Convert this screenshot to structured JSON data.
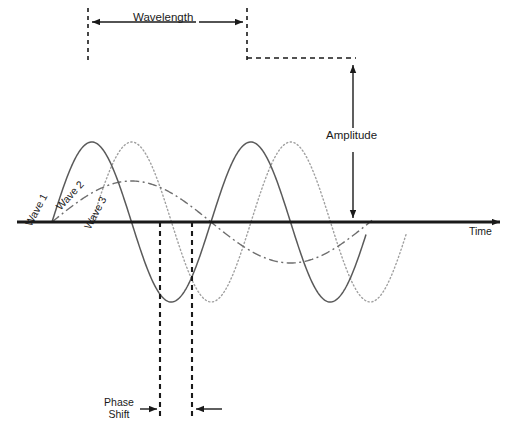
{
  "labels": {
    "wavelength": "Wavelength",
    "amplitude": "Amplitude",
    "time_axis": "Time",
    "phase_shift_line1": "Phase",
    "phase_shift_line2": "Shift",
    "wave_1": "Wave 1",
    "wave_2": "Wave 2",
    "wave_3": "Wave 3"
  },
  "colors": {
    "axis": "#1a1a1a",
    "text": "#1a1a1a",
    "wave_1": "#5a5a5a",
    "wave_2": "#6e6e6e",
    "wave_3": "#a0a0a0",
    "guide_dashed": "#1a1a1a",
    "background": "#ffffff"
  },
  "chart_data": {
    "type": "line",
    "xlabel": "Time",
    "ylabel": "",
    "grid": false,
    "legend": "inline-rotated-labels",
    "axis": {
      "baseline_y_px": 222,
      "x_start_px": 17,
      "x_end_px": 505,
      "arrowhead": "right"
    },
    "series": [
      {
        "name": "Wave 1",
        "style": "solid",
        "color": "#5a5a5a",
        "amplitude_px": 160,
        "wavelength_px": 159,
        "phase_offset_px": 52,
        "x_start_px": 52,
        "x_end_px": 366,
        "crest_x_px": [
          88,
          247
        ],
        "crest_y_px": 62,
        "trough_x_px": [
          168,
          327
        ],
        "trough_y_px": 382
      },
      {
        "name": "Wave 2",
        "style": "dash-dot",
        "color": "#6e6e6e",
        "amplitude_px": 82,
        "wavelength_px": 318,
        "phase_offset_px": 52,
        "x_start_px": 52,
        "x_end_px": 372,
        "crest_x_px": [
          131
        ],
        "crest_y_px": 140,
        "trough_x_px": [
          290
        ],
        "trough_y_px": 304
      },
      {
        "name": "Wave 3",
        "style": "dotted",
        "color": "#a0a0a0",
        "amplitude_px": 160,
        "wavelength_px": 159,
        "phase_offset_px": 92,
        "x_start_px": 92,
        "x_end_px": 406,
        "crest_x_px": [
          128,
          287
        ],
        "crest_y_px": 62,
        "trough_x_px": [
          208,
          367
        ],
        "trough_y_px": 382
      }
    ],
    "annotations": [
      {
        "name": "wavelength",
        "label": "Wavelength",
        "type": "double-arrow-horizontal",
        "from_x_px": 88,
        "to_x_px": 247,
        "y_px": 22
      },
      {
        "name": "amplitude",
        "label": "Amplitude",
        "type": "double-arrow-vertical",
        "x_px": 353,
        "from_y_px": 62,
        "to_y_px": 222
      },
      {
        "name": "phase-shift",
        "label": "Phase Shift",
        "type": "inward-arrows-horizontal",
        "from_x_px": 160,
        "to_x_px": 192,
        "y_px": 409
      }
    ],
    "guides": [
      {
        "name": "wavelength-left-marker",
        "type": "vertical-dashed",
        "x_px": 88,
        "y1_px": 8,
        "y2_px": 64
      },
      {
        "name": "wavelength-right-marker",
        "type": "vertical-dashed",
        "x_px": 247,
        "y1_px": 8,
        "y2_px": 64
      },
      {
        "name": "amplitude-crest-marker",
        "type": "horizontal-dashed",
        "y_px": 58,
        "x1_px": 247,
        "x2_px": 356
      },
      {
        "name": "phase-shift-left-marker",
        "type": "vertical-dashed",
        "x_px": 160,
        "y1_px": 222,
        "y2_px": 420
      },
      {
        "name": "phase-shift-right-marker",
        "type": "vertical-dashed",
        "x_px": 192,
        "y1_px": 222,
        "y2_px": 420
      }
    ]
  }
}
